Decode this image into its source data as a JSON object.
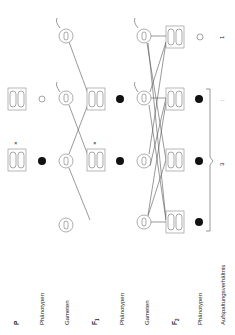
{
  "labels": {
    "p": "P",
    "phenotypes_1": "Phänotypen",
    "gametes_1": "Gameten",
    "f1": "F",
    "f1_sub": "1",
    "phenotypes_2": "Phänotypen",
    "gametes_2": "Gameten",
    "f2": "F",
    "f2_sub": "2",
    "phenotypes_3": "Phänotypen",
    "ratio": "Aufspaltungsverhältnis"
  },
  "symbols": {
    "cross_1": "×",
    "cross_2": "×",
    "ratio_dominant": "3",
    "ratio_sep": ":",
    "ratio_recessive": "1"
  },
  "genotypes": {
    "P_recessive": [
      "a a",
      "a a"
    ],
    "P_dominant": [
      "A A",
      "A A"
    ],
    "gamete_a": "a",
    "gamete_A": "A",
    "F1": [
      "A a",
      "A a"
    ],
    "F2_AA": [
      "A A",
      "A A"
    ],
    "F2_Aa": [
      "A a",
      "A a"
    ],
    "F2_aa": [
      "a a",
      "a a"
    ]
  },
  "colors": {
    "dominant_phenotype": "#111111",
    "recessive_phenotype": "#ffffff",
    "stroke": "#666666"
  },
  "orientation": "rotated 90deg counter-clockwise"
}
